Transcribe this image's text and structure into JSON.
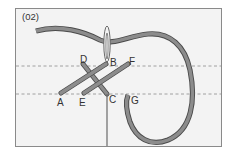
{
  "figure": {
    "step_label": "(02)",
    "colors": {
      "background": "#ffffff",
      "panel_fill": "#f3f3f3",
      "panel_border": "#8a8a8a",
      "thread_fill": "#8c8c8c",
      "thread_outline": "#4a4a4a",
      "needle": "#6a6a6a",
      "guide_line": "#8a8a8a",
      "label_text": "#333333"
    },
    "guide_lines": [
      {
        "name": "upper-guide-line",
        "y": 66
      },
      {
        "name": "lower-guide-line",
        "y": 94
      }
    ],
    "points": [
      {
        "id": "A",
        "label": "A"
      },
      {
        "id": "B",
        "label": "B"
      },
      {
        "id": "C",
        "label": "C"
      },
      {
        "id": "D",
        "label": "D"
      },
      {
        "id": "E",
        "label": "E"
      },
      {
        "id": "F",
        "label": "F"
      },
      {
        "id": "G",
        "label": "G"
      }
    ],
    "stitches": [
      {
        "from": "A",
        "to": "B"
      },
      {
        "from": "D",
        "to": "C"
      },
      {
        "from": "E",
        "to": "F"
      }
    ]
  }
}
